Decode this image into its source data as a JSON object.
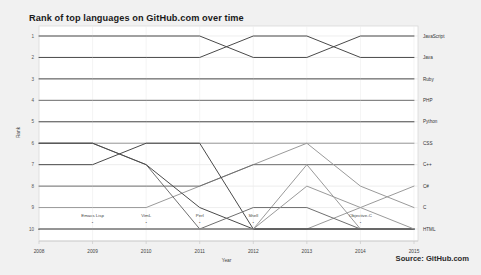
{
  "title": "Rank of top languages on GitHub.com over time",
  "source": "Source: GitHub.com",
  "colors": {
    "background": "#f1f1f1",
    "panel": "#ffffff",
    "grid": "#e3e3e3",
    "line_dark": "#4a4a4a",
    "line_mid": "#6f6f6f",
    "line_light": "#9a9a9a",
    "text": "#333333"
  },
  "chart_data": {
    "type": "line",
    "title": "Rank of top languages on GitHub.com over time",
    "xlabel": "Year",
    "ylabel": "Rank",
    "x": [
      2008,
      2009,
      2010,
      2011,
      2012,
      2013,
      2014,
      2015
    ],
    "xticks": [
      "2008",
      "2009",
      "2010",
      "2011",
      "2012",
      "2013",
      "2014",
      "2015"
    ],
    "yticks": [
      "1",
      "2",
      "3",
      "4",
      "5",
      "6",
      "7",
      "8",
      "9",
      "10"
    ],
    "ylim": [
      1,
      10
    ],
    "y_inverted": true,
    "grid": true,
    "legend": "right-end-labels",
    "series": [
      {
        "name": "JavaScript",
        "values": [
          1,
          1,
          1,
          1,
          2,
          2,
          1,
          1
        ],
        "end_label": "JavaScript",
        "color": "#4a4a4a"
      },
      {
        "name": "Java",
        "values": [
          2,
          2,
          2,
          2,
          1,
          1,
          2,
          2
        ],
        "end_label": "Java",
        "color": "#4a4a4a"
      },
      {
        "name": "Ruby",
        "values": [
          3,
          3,
          3,
          3,
          3,
          3,
          3,
          3
        ],
        "end_label": "Ruby",
        "color": "#4a4a4a"
      },
      {
        "name": "PHP",
        "values": [
          4,
          4,
          4,
          4,
          4,
          4,
          4,
          4
        ],
        "end_label": "PHP",
        "color": "#6f6f6f"
      },
      {
        "name": "Python",
        "values": [
          5,
          5,
          5,
          5,
          5,
          5,
          5,
          5
        ],
        "end_label": "Python",
        "color": "#4a4a4a"
      },
      {
        "name": "CSS",
        "values": [
          9,
          9,
          9,
          8,
          7,
          6,
          6,
          6
        ],
        "end_label": "CSS",
        "color": "#9a9a9a"
      },
      {
        "name": "C++",
        "values": [
          8,
          8,
          8,
          8,
          7,
          7,
          7,
          7
        ],
        "end_label": "C++",
        "color": "#6f6f6f"
      },
      {
        "name": "C#",
        "values": [
          10,
          10,
          10,
          10,
          10,
          10,
          9,
          8
        ],
        "end_label": "C#",
        "color": "#9a9a9a"
      },
      {
        "name": "C",
        "values": [
          6,
          6,
          6,
          6,
          6,
          6,
          8,
          9
        ],
        "end_label": "C",
        "color": "#9a9a9a"
      },
      {
        "name": "HTML",
        "values": [
          10,
          10,
          10,
          10,
          10,
          7,
          10,
          10
        ],
        "end_label": "HTML",
        "color": "#9a9a9a"
      },
      {
        "name": "Emacs Lisp",
        "values": [
          7,
          7,
          6,
          6,
          10,
          10,
          10,
          10
        ],
        "end_label": "",
        "color": "#4a4a4a",
        "inline_label": "Emacs Lisp",
        "inline_x": 2009
      },
      {
        "name": "VimL",
        "values": [
          6,
          6,
          7,
          10,
          10,
          10,
          10,
          10
        ],
        "end_label": "",
        "color": "#6f6f6f",
        "inline_label": "VimL",
        "inline_x": 2010
      },
      {
        "name": "Perl",
        "values": [
          6,
          6,
          7,
          9,
          10,
          10,
          10,
          10
        ],
        "end_label": "",
        "color": "#4a4a4a",
        "inline_label": "Perl",
        "inline_x": 2011
      },
      {
        "name": "Shell",
        "values": [
          10,
          10,
          10,
          10,
          9,
          9,
          10,
          10
        ],
        "end_label": "",
        "color": "#6f6f6f",
        "inline_label": "Shell",
        "inline_x": 2012
      },
      {
        "name": "Objective-C",
        "values": [
          10,
          10,
          10,
          10,
          10,
          8,
          9,
          10
        ],
        "end_label": "",
        "color": "#9a9a9a",
        "inline_label": "Objective-C",
        "inline_x": 2014
      }
    ],
    "inline_annotations": [
      {
        "text": "Emacs Lisp",
        "x": 2009
      },
      {
        "text": "VimL",
        "x": 2010
      },
      {
        "text": "Perl",
        "x": 2011
      },
      {
        "text": "Shell",
        "x": 2012
      },
      {
        "text": "Objective-C",
        "x": 2014
      }
    ]
  }
}
